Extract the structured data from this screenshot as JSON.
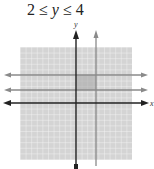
{
  "title": {
    "lower": "2",
    "op1": " ≤ ",
    "var": "y",
    "op2": " ≤ ",
    "upper": "4"
  },
  "graph": {
    "x_axis_label": "x",
    "y_axis_label": "y",
    "inequality": "2 ≤ y ≤ 4",
    "boundary_lines": [
      "y = 2",
      "y = 4"
    ],
    "shaded_region": "between y = 2 and y = 4",
    "colors": {
      "grid_bg": "#d4d4d4",
      "grid_line": "#efefef",
      "axis": "#222222",
      "boundary": "#8a8a8a",
      "shade": "#a8a8a8"
    }
  }
}
